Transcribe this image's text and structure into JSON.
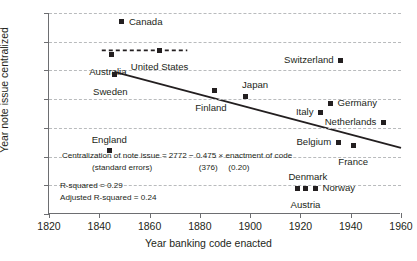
{
  "chart_data": {
    "type": "scatter",
    "title": "",
    "xlabel": "Year banking code enacted",
    "ylabel": "Year note issue centralized",
    "xlim": [
      1820,
      1960
    ],
    "ylim": [
      1800,
      1940
    ],
    "xticks": [
      1820,
      1840,
      1860,
      1880,
      1900,
      1920,
      1940,
      1960
    ],
    "yticks": [
      1800,
      1820,
      1840,
      1860,
      1880,
      1900,
      1920,
      1940
    ],
    "grid": "horizontal-dashed",
    "legend": "none",
    "points": [
      {
        "label": "Canada",
        "x": 1849,
        "y": 1934,
        "label_pos": "right"
      },
      {
        "label": "Australia",
        "x": 1845,
        "y": 1911,
        "label_pos": "below-left"
      },
      {
        "label": "United States",
        "x": 1864,
        "y": 1914,
        "label_pos": "below"
      },
      {
        "label": "Sweden",
        "x": 1846,
        "y": 1897,
        "label_pos": "below-left"
      },
      {
        "label": "Finland",
        "x": 1886,
        "y": 1886,
        "label_pos": "below-left"
      },
      {
        "label": "Japan",
        "x": 1898,
        "y": 1882,
        "label_pos": "above-right"
      },
      {
        "label": "Switzerland",
        "x": 1936,
        "y": 1907,
        "label_pos": "left"
      },
      {
        "label": "Germany",
        "x": 1932,
        "y": 1877,
        "label_pos": "right"
      },
      {
        "label": "Italy",
        "x": 1928,
        "y": 1871,
        "label_pos": "left"
      },
      {
        "label": "Netherlands",
        "x": 1953,
        "y": 1864,
        "label_pos": "left"
      },
      {
        "label": "Belgium",
        "x": 1935,
        "y": 1850,
        "label_pos": "left"
      },
      {
        "label": "France",
        "x": 1941,
        "y": 1848,
        "label_pos": "below"
      },
      {
        "label": "England",
        "x": 1844,
        "y": 1844,
        "label_pos": "above"
      },
      {
        "label": "Denmark",
        "x": 1919,
        "y": 1818,
        "label_pos": "above-right"
      },
      {
        "label": "Austria",
        "x": 1922,
        "y": 1818,
        "label_pos": "below"
      },
      {
        "label": "Norway",
        "x": 1926,
        "y": 1818,
        "label_pos": "right"
      }
    ],
    "trend_line": {
      "style": "solid",
      "x0": 1846,
      "y0": 1899,
      "x1": 1960,
      "y1": 1846
    },
    "reference_line": {
      "style": "dashed",
      "y": 1914,
      "x0": 1841,
      "x1": 1875
    },
    "annotation": {
      "equation": "Centralization of note issue = 2772 − 0.475 × enactment of code",
      "standard_errors": "(standard errors)",
      "se_coef1": "(376)",
      "se_coef2": "(0.20)",
      "r_squared": "R-squared = 0.29",
      "adj_r_squared": "Adjusted R-squared = 0.24"
    },
    "colors": {
      "marker": "#231f20",
      "line": "#231f20",
      "grid": "#b9bbbd",
      "axis": "#6d6e71",
      "background": "#ffffff"
    }
  }
}
